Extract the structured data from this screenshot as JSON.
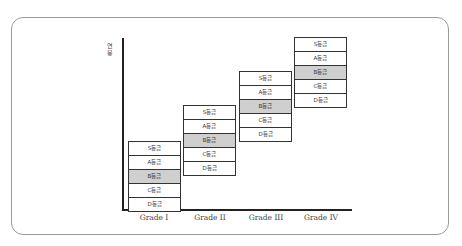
{
  "diagram": {
    "y_axis_label": "연봉",
    "grade_levels": [
      "S등급",
      "A등급",
      "B등급",
      "C등급",
      "D등급"
    ],
    "highlighted_level": "B등급",
    "columns": [
      {
        "label": "Grade I",
        "rows": [
          "S등급",
          "A등급",
          "B등급",
          "C등급",
          "D등급"
        ]
      },
      {
        "label": "Grade II",
        "rows": [
          "S등급",
          "A등급",
          "B등급",
          "C등급",
          "D등급"
        ]
      },
      {
        "label": "Grade III",
        "rows": [
          "S등급",
          "A등급",
          "B등급",
          "C등급",
          "D등급"
        ]
      },
      {
        "label": "Grade IV",
        "rows": [
          "S등급",
          "A등급",
          "B등급",
          "C등급",
          "D등급"
        ]
      }
    ],
    "colors": {
      "highlight": "#cfcfcf",
      "border": "#333333",
      "frame": "#9a9a9a"
    }
  }
}
